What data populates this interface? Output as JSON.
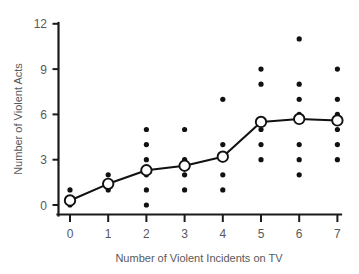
{
  "chart_data": {
    "type": "scatter",
    "title": "",
    "subtitle": "",
    "xlabel": "Number of Violent Incidents on TV",
    "ylabel": "Number of Violent Acts",
    "xlim": [
      -0.45,
      7.45
    ],
    "ylim": [
      0,
      12
    ],
    "xticks": [
      0,
      1,
      2,
      3,
      4,
      5,
      6,
      7
    ],
    "xtick_labels": [
      "0",
      "1",
      "2",
      "3",
      "4",
      "5",
      "6",
      "7"
    ],
    "yticks": [
      0,
      3,
      6,
      9,
      12
    ],
    "ytick_labels": [
      "0",
      "3",
      "6",
      "9",
      "12"
    ],
    "grid": false,
    "legend": null,
    "legend_position": "none",
    "series": [
      {
        "name": "Individual observations",
        "type": "scatter",
        "marker": "filled-circle",
        "color": "#111111",
        "points": [
          {
            "x": 0,
            "y": 0
          },
          {
            "x": 0,
            "y": 1
          },
          {
            "x": 1,
            "y": 1
          },
          {
            "x": 1,
            "y": 2
          },
          {
            "x": 2,
            "y": 0
          },
          {
            "x": 2,
            "y": 1
          },
          {
            "x": 2,
            "y": 2
          },
          {
            "x": 2,
            "y": 3
          },
          {
            "x": 2,
            "y": 4
          },
          {
            "x": 2,
            "y": 5
          },
          {
            "x": 3,
            "y": 1
          },
          {
            "x": 3,
            "y": 2
          },
          {
            "x": 3,
            "y": 3
          },
          {
            "x": 3,
            "y": 5
          },
          {
            "x": 4,
            "y": 1
          },
          {
            "x": 4,
            "y": 2
          },
          {
            "x": 4,
            "y": 3
          },
          {
            "x": 4,
            "y": 4
          },
          {
            "x": 4,
            "y": 7
          },
          {
            "x": 5,
            "y": 3
          },
          {
            "x": 5,
            "y": 4
          },
          {
            "x": 5,
            "y": 5
          },
          {
            "x": 5,
            "y": 8
          },
          {
            "x": 5,
            "y": 9
          },
          {
            "x": 6,
            "y": 2
          },
          {
            "x": 6,
            "y": 3
          },
          {
            "x": 6,
            "y": 4
          },
          {
            "x": 6,
            "y": 6
          },
          {
            "x": 6,
            "y": 7
          },
          {
            "x": 6,
            "y": 8
          },
          {
            "x": 6,
            "y": 11
          },
          {
            "x": 7,
            "y": 3
          },
          {
            "x": 7,
            "y": 4
          },
          {
            "x": 7,
            "y": 5
          },
          {
            "x": 7,
            "y": 6
          },
          {
            "x": 7,
            "y": 7
          },
          {
            "x": 7,
            "y": 9
          }
        ]
      },
      {
        "name": "Mean violent acts",
        "type": "line",
        "marker": "open-circle",
        "color": "#111111",
        "x": [
          0,
          1,
          2,
          3,
          4,
          5,
          6,
          7
        ],
        "values": [
          0.3,
          1.4,
          2.3,
          2.6,
          3.2,
          5.5,
          5.7,
          5.6
        ]
      }
    ]
  },
  "axes": {
    "y_title": "Number of Violent Acts",
    "x_title": "Number of Violent Incidents on TV"
  },
  "colors": {
    "ink": "#111111",
    "label": "#58595b",
    "background": "#ffffff"
  }
}
